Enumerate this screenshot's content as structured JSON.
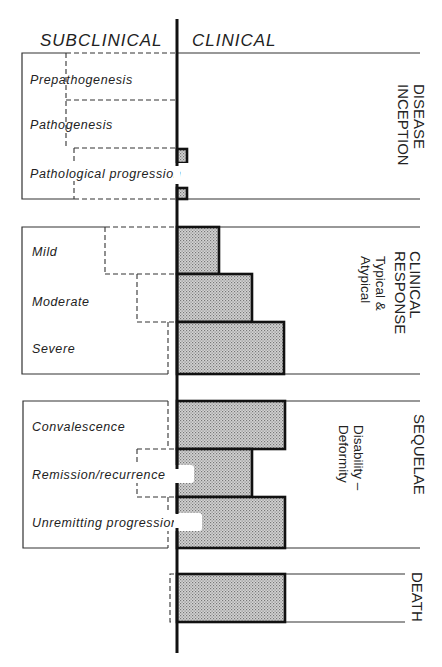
{
  "headers": {
    "subclinical": "SUBCLINICAL",
    "clinical": "CLINICAL"
  },
  "sections": [
    {
      "id": "disease-inception",
      "side_label": [
        "DISEASE",
        "INCEPTION"
      ],
      "sub_label": null,
      "stages": [
        "Prepathogenesis",
        "Pathogenesis",
        "Pathological progression"
      ]
    },
    {
      "id": "clinical-response",
      "side_label": [
        "CLINICAL",
        "RESPONSE"
      ],
      "sub_label": [
        "Typical  &",
        "Atypical"
      ],
      "stages": [
        "Mild",
        "Moderate",
        "Severe"
      ]
    },
    {
      "id": "sequelae",
      "side_label": [
        "SEQUELAE"
      ],
      "sub_label": [
        "Disability –",
        "Deformity"
      ],
      "stages": [
        "Convalescence",
        "Remission/recurrence",
        "Unremitting progression"
      ]
    },
    {
      "id": "death",
      "side_label": [
        "DEATH"
      ],
      "sub_label": null,
      "stages": []
    }
  ],
  "colors": {
    "ink": "#111111",
    "fill": "#c8c8c8",
    "background": "#ffffff"
  }
}
